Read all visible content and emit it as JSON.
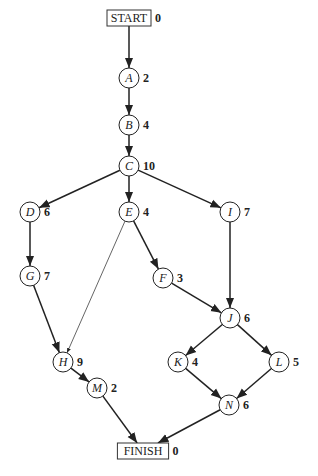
{
  "diagram": {
    "type": "activity-on-node network",
    "nodes": [
      {
        "id": "START",
        "label": "START",
        "duration": "0",
        "shape": "box",
        "x": 129,
        "y": 18
      },
      {
        "id": "A",
        "label": "A",
        "duration": "2",
        "shape": "circle",
        "x": 129,
        "y": 78
      },
      {
        "id": "B",
        "label": "B",
        "duration": "4",
        "shape": "circle",
        "x": 129,
        "y": 125
      },
      {
        "id": "C",
        "label": "C",
        "duration": "10",
        "shape": "circle",
        "x": 129,
        "y": 166
      },
      {
        "id": "D",
        "label": "D",
        "duration": "6",
        "shape": "circle",
        "x": 30,
        "y": 212
      },
      {
        "id": "E",
        "label": "E",
        "duration": "4",
        "shape": "circle",
        "x": 129,
        "y": 212
      },
      {
        "id": "I",
        "label": "I",
        "duration": "7",
        "shape": "circle",
        "x": 230,
        "y": 212
      },
      {
        "id": "G",
        "label": "G",
        "duration": "7",
        "shape": "circle",
        "x": 30,
        "y": 276
      },
      {
        "id": "F",
        "label": "F",
        "duration": "3",
        "shape": "circle",
        "x": 163,
        "y": 278
      },
      {
        "id": "J",
        "label": "J",
        "duration": "6",
        "shape": "circle",
        "x": 230,
        "y": 318
      },
      {
        "id": "H",
        "label": "H",
        "duration": "9",
        "shape": "circle",
        "x": 63,
        "y": 362
      },
      {
        "id": "K",
        "label": "K",
        "duration": "4",
        "shape": "circle",
        "x": 178,
        "y": 362
      },
      {
        "id": "L",
        "label": "L",
        "duration": "5",
        "shape": "circle",
        "x": 279,
        "y": 362
      },
      {
        "id": "M",
        "label": "M",
        "duration": "2",
        "shape": "circle",
        "x": 97,
        "y": 388
      },
      {
        "id": "N",
        "label": "N",
        "duration": "6",
        "shape": "circle",
        "x": 229,
        "y": 405
      },
      {
        "id": "FINISH",
        "label": "FINISH",
        "duration": "0",
        "shape": "box",
        "x": 143,
        "y": 451
      }
    ],
    "edges": [
      {
        "from": "START",
        "to": "A",
        "weight": "bold"
      },
      {
        "from": "A",
        "to": "B",
        "weight": "bold"
      },
      {
        "from": "B",
        "to": "C",
        "weight": "bold"
      },
      {
        "from": "C",
        "to": "D",
        "weight": "bold"
      },
      {
        "from": "C",
        "to": "E",
        "weight": "bold"
      },
      {
        "from": "C",
        "to": "I",
        "weight": "bold"
      },
      {
        "from": "D",
        "to": "G",
        "weight": "bold"
      },
      {
        "from": "G",
        "to": "H",
        "weight": "bold"
      },
      {
        "from": "E",
        "to": "H",
        "weight": "thin"
      },
      {
        "from": "E",
        "to": "F",
        "weight": "bold"
      },
      {
        "from": "F",
        "to": "J",
        "weight": "bold"
      },
      {
        "from": "I",
        "to": "J",
        "weight": "bold"
      },
      {
        "from": "J",
        "to": "K",
        "weight": "bold"
      },
      {
        "from": "J",
        "to": "L",
        "weight": "bold"
      },
      {
        "from": "H",
        "to": "M",
        "weight": "bold"
      },
      {
        "from": "K",
        "to": "N",
        "weight": "bold"
      },
      {
        "from": "L",
        "to": "N",
        "weight": "bold"
      },
      {
        "from": "M",
        "to": "FINISH",
        "weight": "bold"
      },
      {
        "from": "N",
        "to": "FINISH",
        "weight": "bold"
      }
    ]
  }
}
